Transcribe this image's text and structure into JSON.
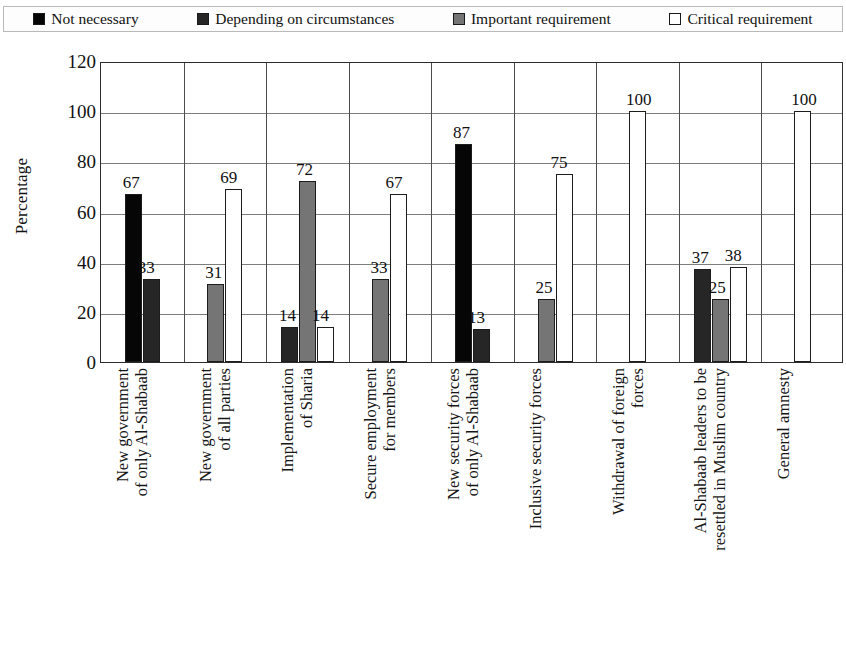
{
  "legend": {
    "items": [
      {
        "label": "Not necessary",
        "color": "#060606",
        "icon": "legend-swatch"
      },
      {
        "label": "Depending on circumstances",
        "color": "#262626",
        "icon": "legend-swatch"
      },
      {
        "label": "Important requirement",
        "color": "#757575",
        "icon": "legend-swatch"
      },
      {
        "label": "Critical requirement",
        "color": "#ffffff",
        "icon": "legend-swatch"
      }
    ]
  },
  "axis": {
    "ylabel": "Percentage",
    "yticks": [
      "120",
      "100",
      "80",
      "60",
      "40",
      "20",
      "0"
    ]
  },
  "chart_data": {
    "type": "bar",
    "title": "",
    "xlabel": "",
    "ylabel": "Percentage",
    "ylim": [
      0,
      120
    ],
    "ytick_step": 20,
    "grid": true,
    "legend_position": "top",
    "categories": [
      "New government of only Al-Shabaab",
      "New government of all parties",
      "Implementation of Sharia",
      "Secure employment for members",
      "New security forces of only Al-Shabaab",
      "Inclusive security forces",
      "Withdrawal of foreign forces",
      "Al-Shabaab leaders to be resettled in Muslim country",
      "General amnesty"
    ],
    "categories_lines": [
      [
        "New government",
        "of only Al-Shabaab"
      ],
      [
        "New government",
        "of all parties"
      ],
      [
        "Implementation",
        "of Sharia"
      ],
      [
        "Secure employment",
        "for members"
      ],
      [
        "New security forces",
        "of only Al-Shabaab"
      ],
      [
        "Inclusive security forces",
        ""
      ],
      [
        "Withdrawal of foreign",
        "forces"
      ],
      [
        "Al-Shabaab leaders to be",
        "resettled in Muslim country"
      ],
      [
        "General amnesty",
        ""
      ]
    ],
    "series": [
      {
        "name": "Not necessary",
        "values": [
          67,
          null,
          null,
          null,
          87,
          null,
          null,
          null,
          null
        ]
      },
      {
        "name": "Depending on circumstances",
        "values": [
          33,
          null,
          14,
          null,
          13,
          null,
          null,
          37,
          null
        ]
      },
      {
        "name": "Important requirement",
        "values": [
          null,
          31,
          72,
          33,
          null,
          25,
          null,
          25,
          null
        ]
      },
      {
        "name": "Critical requirement",
        "values": [
          null,
          69,
          14,
          67,
          null,
          75,
          100,
          38,
          100
        ]
      }
    ]
  }
}
